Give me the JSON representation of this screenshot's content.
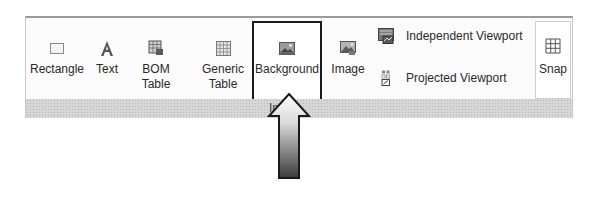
{
  "ribbon": {
    "panel_label": "In",
    "buttons": [
      {
        "label": "Rectangle",
        "icon": "rectangle-icon"
      },
      {
        "label": "Text",
        "icon": "text-icon"
      },
      {
        "label": "BOM Table",
        "icon": "bom-table-icon"
      },
      {
        "label": "Generic\nTable",
        "line1": "Generic",
        "line2": "Table",
        "icon": "generic-table-icon"
      },
      {
        "label": "Background",
        "icon": "background-icon",
        "highlighted": true
      },
      {
        "label": "Image",
        "icon": "image-icon"
      }
    ],
    "viewports": [
      {
        "label": "Independent Viewport",
        "icon": "independent-viewport-icon"
      },
      {
        "label": "Projected Viewport",
        "icon": "projected-viewport-icon"
      }
    ],
    "snap": {
      "label": "Snap",
      "icon": "snap-grid-icon"
    }
  },
  "annotation": {
    "type": "arrow-up",
    "target": "Background"
  },
  "colors": {
    "highlight_border": "#1a1a1a",
    "band": "#d6d6d6"
  }
}
